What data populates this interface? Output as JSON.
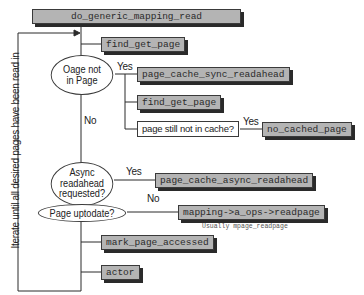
{
  "diagram": {
    "root": "do_generic_mapping_read",
    "loop_label": "Iterate until all desired pages have been read in",
    "nodes": {
      "find_get_page_1": "find_get_page",
      "decision_page_not_in_page_line1": "Oage not",
      "decision_page_not_in_page_line2": "in Page",
      "sync_readahead": "page_cache_sync_readahead",
      "find_get_page_2": "find_get_page",
      "decision_still_not_cached": "page still not in cache?",
      "no_cached_page": "no_cached_page",
      "decision_async_line1": "Async",
      "decision_async_line2": "readahead",
      "decision_async_line3": "requested?",
      "async_readahead": "page_cache_async_readahead",
      "decision_uptodate": "Page uptodate?",
      "readpage": "mapping->a_ops->readpage",
      "readpage_note": "Usually mpage_readpage",
      "mark_page_accessed": "mark_page_accessed",
      "actor": "actor"
    },
    "edge_labels": {
      "yes_1": "Yes",
      "no_1": "No",
      "yes_2": "Yes",
      "yes_3": "Yes",
      "no_2": "No"
    }
  }
}
